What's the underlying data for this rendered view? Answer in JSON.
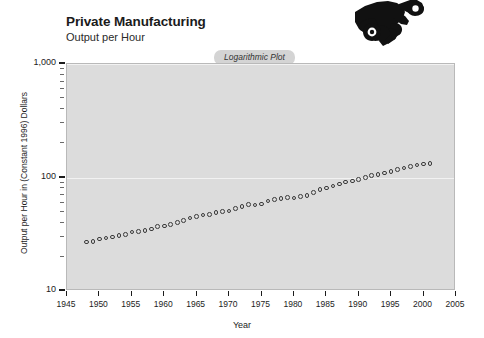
{
  "header": {
    "title": "Private Manufacturing",
    "subtitle": "Output per Hour",
    "badge": "Logarithmic Plot",
    "logo_icon": "hand-holding-wrench-icon"
  },
  "chart_data": {
    "type": "line",
    "title": "Private Manufacturing",
    "subtitle": "Output per Hour",
    "annotation": "Logarithmic Plot",
    "xlabel": "Year",
    "ylabel": "Output per Hour in (Constant 1996) Dollars",
    "yscale": "log",
    "ylim": [
      10,
      1000
    ],
    "xlim": [
      1945,
      2005
    ],
    "ytick_labels": [
      "1,000",
      "100",
      "10"
    ],
    "ytick_values": [
      1000,
      100,
      10
    ],
    "xtick_labels": [
      "1945",
      "1950",
      "1955",
      "1960",
      "1965",
      "1970",
      "1975",
      "1980",
      "1985",
      "1990",
      "1995",
      "2000",
      "2005"
    ],
    "xtick_values": [
      1945,
      1950,
      1955,
      1960,
      1965,
      1970,
      1975,
      1980,
      1985,
      1990,
      1995,
      2000,
      2005
    ],
    "grid": true,
    "legend": false,
    "marker": "open-circle",
    "series_name": "Output per Hour",
    "x": [
      1948,
      1949,
      1950,
      1951,
      1952,
      1953,
      1954,
      1955,
      1956,
      1957,
      1958,
      1959,
      1960,
      1961,
      1962,
      1963,
      1964,
      1965,
      1966,
      1967,
      1968,
      1969,
      1970,
      1971,
      1972,
      1973,
      1974,
      1975,
      1976,
      1977,
      1978,
      1979,
      1980,
      1981,
      1982,
      1983,
      1984,
      1985,
      1986,
      1987,
      1988,
      1989,
      1990,
      1991,
      1992,
      1993,
      1994,
      1995,
      1996,
      1997,
      1998,
      1999,
      2000,
      2001
    ],
    "values": [
      27.0,
      27.4,
      28.6,
      29.2,
      29.8,
      30.8,
      31.5,
      33.0,
      33.3,
      34.2,
      35.1,
      36.8,
      37.4,
      38.6,
      40.3,
      42.0,
      43.8,
      45.3,
      46.6,
      47.3,
      49.0,
      50.0,
      50.7,
      53.2,
      55.8,
      58.0,
      57.4,
      58.6,
      62.0,
      64.2,
      65.6,
      66.3,
      66.0,
      68.0,
      69.4,
      73.5,
      78.0,
      81.0,
      84.5,
      87.5,
      91.0,
      93.5,
      96.5,
      99.5,
      104.0,
      106.5,
      109.5,
      113.0,
      117.0,
      121.0,
      125.0,
      129.0,
      132.0,
      133.0
    ]
  }
}
